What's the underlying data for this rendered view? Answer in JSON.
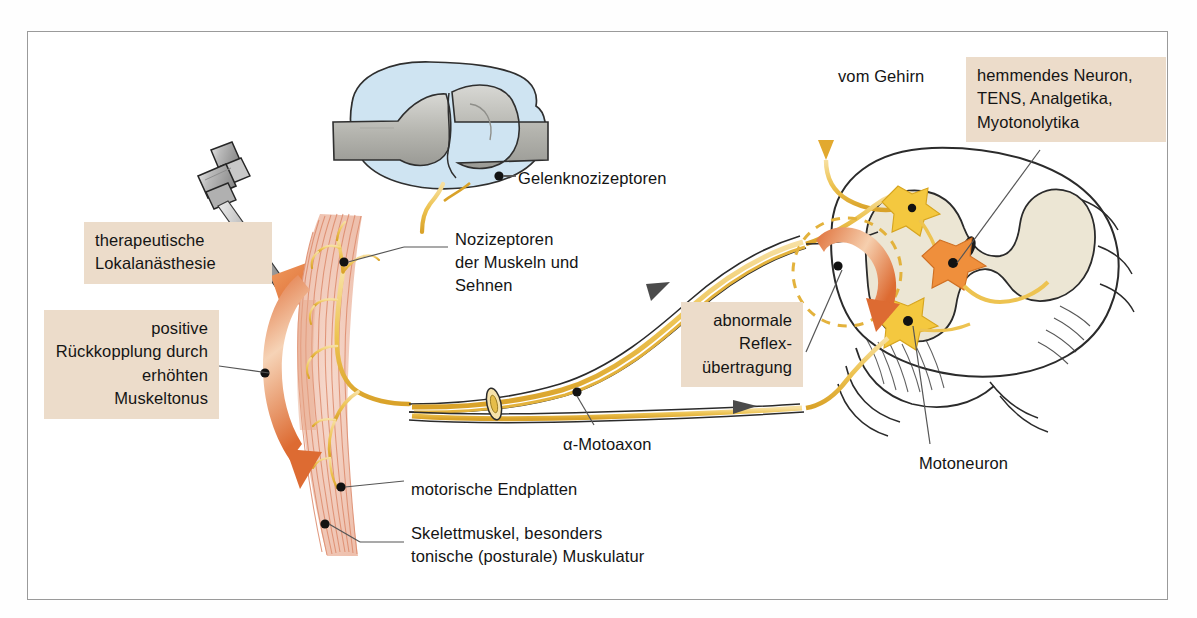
{
  "figure": {
    "border_color": "#9a9a9a",
    "background": "#ffffff"
  },
  "palette": {
    "label_box_bg": "#ecdcca",
    "nerve_yellow": "#e8b93d",
    "nerve_yellow_light": "#f5dd95",
    "arrow_orange": "#e07a3c",
    "arrow_orange_light": "#f3c6a4",
    "neuron_orange": "#ef8f3c",
    "neuron_yellow": "#f2c43c",
    "gray_matter": "#ece6d4",
    "bone_gray": "#b9b9b4",
    "synovial_blue": "#cfe4f2",
    "muscle_pink": "#e79b82",
    "outline": "#2b2b2b",
    "leader_line": "#555555",
    "text": "#141414"
  },
  "label_boxes": [
    {
      "name": "therapeutische-lokalanaesthesie",
      "lines": [
        "therapeutische",
        "Lokalanästhesie"
      ],
      "text": "therapeutische\nLokalanästhesie",
      "align": "left",
      "x": 84,
      "y": 222,
      "w": 188,
      "h": 56
    },
    {
      "name": "positive-rueckkopplung",
      "lines": [
        "positive",
        "Rückkopplung",
        "durch erhöhten",
        "Muskeltonus"
      ],
      "text": "positive\nRückkopplung\ndurch erhöhten\nMuskeltonus",
      "align": "right",
      "x": 44,
      "y": 310,
      "w": 175,
      "h": 105
    },
    {
      "name": "abnormale-reflexuebertragung",
      "lines": [
        "abnormale",
        "Reflex-",
        "übertragung"
      ],
      "text": "abnormale\nReflex-\nübertragung",
      "align": "right",
      "x": 681,
      "y": 302,
      "w": 122,
      "h": 81
    },
    {
      "name": "hemmendes-neuron-tens",
      "lines": [
        "hemmendes Neuron,",
        "TENS, Analgetika,",
        "Myotonolytika"
      ],
      "text": "hemmendes Neuron,\nTENS, Analgetika,\nMyotonolytika",
      "align": "left",
      "x": 966,
      "y": 57,
      "w": 200,
      "h": 81
    }
  ],
  "plain_labels": [
    {
      "name": "gelenknozizeptoren",
      "text": "Gelenknozizeptoren",
      "x": 518,
      "y": 167
    },
    {
      "name": "nozizeptoren-muskeln-sehnen",
      "text": "Nozizeptoren\nder Muskeln und\nSehnen",
      "x": 455,
      "y": 228
    },
    {
      "name": "vom-gehirn",
      "text": "vom Gehirn",
      "x": 838,
      "y": 65
    },
    {
      "name": "alpha-motoaxon",
      "text": "α-Motoaxon",
      "x": 563,
      "y": 433
    },
    {
      "name": "motorische-endplatten",
      "text": "motorische Endplatten",
      "x": 411,
      "y": 478
    },
    {
      "name": "skelettmuskel",
      "text": "Skelettmuskel, besonders\ntonische (posturale) Muskulatur",
      "x": 411,
      "y": 522
    },
    {
      "name": "motoneuron",
      "text": "Motoneuron",
      "x": 919,
      "y": 452
    }
  ],
  "anatomy": {
    "joint": {
      "name": "joint-with-nociceptors",
      "description": "Gelenk im Längsschnitt mit Knochen und Gelenkkapsel"
    },
    "syringe": {
      "name": "syringe",
      "description": "Spritze für die therapeutische Lokalanästhesie"
    },
    "muscle": {
      "name": "skeletal-muscle",
      "description": "Skelettmuskel mit motorischen Endplatten"
    },
    "spinal_cord": {
      "name": "spinal-cord-cross-section",
      "description": "Rückenmarksquerschnitt mit Schmetterlingsfigur der grauen Substanz"
    },
    "neurons": [
      {
        "name": "inhibitory-interneuron",
        "color": "#f2c43c"
      },
      {
        "name": "nociceptive-relay-neuron",
        "color": "#ef8f3c"
      },
      {
        "name": "alpha-motoneuron",
        "color": "#f2c43c"
      }
    ],
    "arrows": [
      {
        "name": "descending-from-brain-arrow",
        "direction": "down",
        "color": "#e8b93d"
      },
      {
        "name": "local-anesthesia-arrow",
        "direction": "down-right",
        "color": "#e07a3c"
      },
      {
        "name": "positive-feedback-arrow",
        "direction": "curved-down",
        "color": "#e07a3c"
      },
      {
        "name": "abnormal-reflex-transfer-arrow",
        "direction": "curved-down-right",
        "color": "#e07a3c"
      }
    ]
  }
}
